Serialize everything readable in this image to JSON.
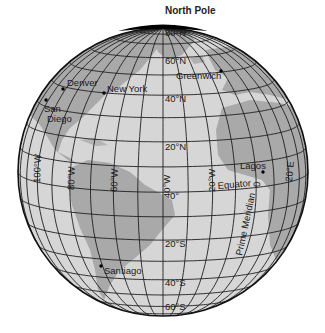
{
  "title": "North Pole",
  "colors": {
    "ocean": "#d6d6d6",
    "land": "#a9a9a9",
    "grid": "#1e1e1e",
    "outline": "#111111"
  },
  "latitudes": [
    {
      "label": "80°N",
      "x": 164,
      "y": 40
    },
    {
      "label": "60°N",
      "x": 164,
      "y": 63
    },
    {
      "label": "40°N",
      "x": 164,
      "y": 101
    },
    {
      "label": "20°N",
      "x": 164,
      "y": 149
    },
    {
      "label": "0°",
      "x": 170,
      "y": 199
    },
    {
      "label": "20°S",
      "x": 164,
      "y": 247
    },
    {
      "label": "40°S",
      "x": 164,
      "y": 286
    },
    {
      "label": "60°S",
      "x": 164,
      "y": 309
    }
  ],
  "longitudes": [
    {
      "label": "100°W",
      "x": 40,
      "y": 177
    },
    {
      "label": "80°W",
      "x": 73,
      "y": 177
    },
    {
      "label": "60°W",
      "x": 115,
      "y": 177
    },
    {
      "label": "40°W",
      "x": 166,
      "y": 180
    },
    {
      "label": "20°W",
      "x": 214,
      "y": 177
    },
    {
      "label": "20°E",
      "x": 292,
      "y": 171
    }
  ],
  "lines": {
    "equator": "Equator",
    "prime_meridian": "Prime Meridian",
    "pm_zero": "0"
  },
  "cities": [
    {
      "name": "Denver",
      "x": 63,
      "y": 89,
      "lx": 67,
      "ly": 86
    },
    {
      "name": "New York",
      "x": 104,
      "y": 93,
      "lx": 107,
      "ly": 91
    },
    {
      "name": "San",
      "x": 45,
      "y": 101,
      "lx": 44,
      "ly": 112
    },
    {
      "name": "Diego",
      "x": null,
      "y": null,
      "lx": 47,
      "ly": 122
    },
    {
      "name": "Greenwich",
      "x": 221,
      "y": 71,
      "lx": 176,
      "ly": 79
    },
    {
      "name": "Lagos",
      "x": 263,
      "y": 172,
      "lx": 240,
      "ly": 169
    },
    {
      "name": "Santiago",
      "x": 101,
      "y": 266,
      "lx": 104,
      "ly": 274
    }
  ]
}
